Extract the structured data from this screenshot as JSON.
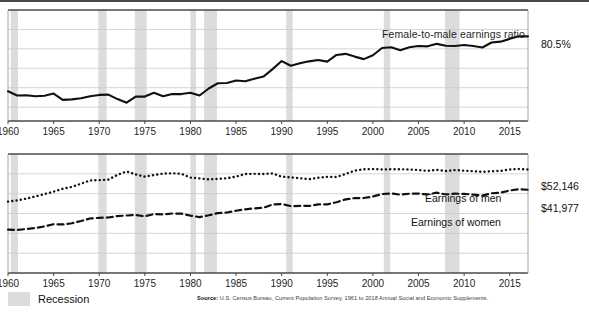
{
  "figure": {
    "top_line_divider": "divider",
    "source_prefix": "Source:",
    "source_text": " U.S. Census Bureau, Current Population Survey, 1961 to 2018 Annual Social and Economic Supplements.",
    "legend": {
      "recession_label": "Recession",
      "recession_color": "#dcdcdc"
    },
    "xticks": [
      "1960",
      "1965",
      "1970",
      "1975",
      "1980",
      "1985",
      "1990",
      "1995",
      "2000",
      "2005",
      "2010",
      "2015"
    ]
  },
  "chart_data": [
    {
      "type": "line",
      "id": "ratio",
      "title": "",
      "annotation": "Female-to-male earnings ratio",
      "end_value_label": "80.5%",
      "xlabel": "",
      "ylabel": "",
      "xlim": [
        1960,
        2017
      ],
      "ylim": [
        50,
        90
      ],
      "grid": true,
      "gridlines": [
        55,
        62,
        69,
        76,
        83
      ],
      "line_style": "solid",
      "line_color": "#111111",
      "x": [
        1960,
        1961,
        1962,
        1963,
        1964,
        1965,
        1966,
        1967,
        1968,
        1969,
        1970,
        1971,
        1972,
        1973,
        1974,
        1975,
        1976,
        1977,
        1978,
        1979,
        1980,
        1981,
        1982,
        1983,
        1984,
        1985,
        1986,
        1987,
        1988,
        1989,
        1990,
        1991,
        1992,
        1993,
        1994,
        1995,
        1996,
        1997,
        1998,
        1999,
        2000,
        2001,
        2002,
        2003,
        2004,
        2005,
        2006,
        2007,
        2008,
        2009,
        2010,
        2011,
        2012,
        2013,
        2014,
        2015,
        2016,
        2017
      ],
      "values": [
        60.7,
        59.2,
        59.3,
        58.9,
        59.1,
        59.9,
        57.6,
        57.8,
        58.2,
        58.9,
        59.4,
        59.5,
        57.9,
        56.6,
        58.8,
        58.8,
        60.2,
        58.9,
        59.7,
        59.7,
        60.2,
        59.2,
        61.7,
        63.6,
        63.7,
        64.6,
        64.3,
        65.2,
        66.0,
        68.7,
        71.6,
        69.9,
        70.8,
        71.5,
        72.0,
        71.4,
        73.8,
        74.2,
        73.2,
        72.3,
        73.7,
        76.3,
        76.6,
        75.5,
        76.6,
        77.0,
        76.9,
        77.8,
        77.1,
        77.0,
        77.4,
        77.0,
        76.5,
        78.3,
        78.6,
        79.6,
        80.5,
        80.5
      ]
    },
    {
      "type": "line",
      "id": "earnings",
      "title": "",
      "xlabel": "",
      "ylabel": "",
      "xlim": [
        1960,
        2017
      ],
      "ylim": [
        0,
        60000
      ],
      "grid": true,
      "gridlines": [
        10000,
        20000,
        30000,
        40000,
        50000
      ],
      "series": [
        {
          "name": "Earnings of men",
          "end_value_label": "$52,146",
          "line_style": "dotted",
          "line_color": "#111111",
          "x": [
            1960,
            1961,
            1962,
            1963,
            1964,
            1965,
            1966,
            1967,
            1968,
            1969,
            1970,
            1971,
            1972,
            1973,
            1974,
            1975,
            1976,
            1977,
            1978,
            1979,
            1980,
            1981,
            1982,
            1983,
            1984,
            1985,
            1986,
            1987,
            1988,
            1989,
            1990,
            1991,
            1992,
            1993,
            1994,
            1995,
            1996,
            1997,
            1998,
            1999,
            2000,
            2001,
            2002,
            2003,
            2004,
            2005,
            2006,
            2007,
            2008,
            2009,
            2010,
            2011,
            2012,
            2013,
            2014,
            2015,
            2016,
            2017
          ],
          "values": [
            36000,
            36600,
            37500,
            38600,
            39800,
            41000,
            42500,
            43400,
            45000,
            46700,
            46800,
            47100,
            49500,
            51200,
            49700,
            48600,
            49400,
            50100,
            50300,
            50000,
            48100,
            47700,
            47200,
            47400,
            47800,
            48600,
            49900,
            50000,
            49900,
            50200,
            48600,
            48200,
            47800,
            47300,
            48000,
            48500,
            48400,
            49900,
            51600,
            52300,
            52400,
            52200,
            52300,
            52300,
            52200,
            51900,
            51500,
            52000,
            51400,
            51900,
            51600,
            51300,
            51000,
            51300,
            51500,
            52200,
            52400,
            52146
          ]
        },
        {
          "name": "Earnings of women",
          "end_value_label": "$41,977",
          "line_style": "dashed",
          "line_color": "#111111",
          "x": [
            1960,
            1961,
            1962,
            1963,
            1964,
            1965,
            1966,
            1967,
            1968,
            1969,
            1970,
            1971,
            1972,
            1973,
            1974,
            1975,
            1976,
            1977,
            1978,
            1979,
            1980,
            1981,
            1982,
            1983,
            1984,
            1985,
            1986,
            1987,
            1988,
            1989,
            1990,
            1991,
            1992,
            1993,
            1994,
            1995,
            1996,
            1997,
            1998,
            1999,
            2000,
            2001,
            2002,
            2003,
            2004,
            2005,
            2006,
            2007,
            2008,
            2009,
            2010,
            2011,
            2012,
            2013,
            2014,
            2015,
            2016,
            2017
          ],
          "values": [
            21900,
            21700,
            22200,
            22700,
            23500,
            24600,
            24500,
            25100,
            26200,
            27500,
            27800,
            28000,
            28700,
            29000,
            29200,
            28600,
            29700,
            29500,
            30000,
            29900,
            28900,
            28200,
            29100,
            30200,
            30500,
            31400,
            32100,
            32600,
            32900,
            34500,
            34800,
            33700,
            33800,
            33800,
            34600,
            34600,
            35700,
            37100,
            37800,
            37800,
            38600,
            39800,
            40100,
            39500,
            40000,
            40000,
            39600,
            40500,
            39600,
            40000,
            39900,
            39500,
            39000,
            40200,
            40500,
            41600,
            42200,
            41977
          ]
        }
      ]
    }
  ]
}
